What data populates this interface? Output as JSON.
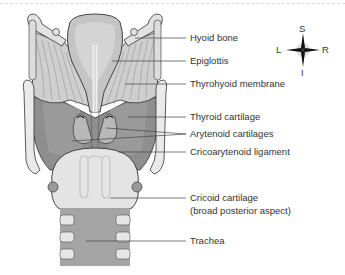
{
  "figure": {
    "colors": {
      "cartilage_dark": "#8c8c8c",
      "cartilage_mid": "#a8a8a8",
      "cartilage_light": "#e6e6e6",
      "membrane": "#c8c8c8",
      "outline": "#333333",
      "leader_line": "#444444"
    }
  },
  "labels": [
    {
      "id": "hyoid-bone",
      "text": "Hyoid bone",
      "y": 32
    },
    {
      "id": "epiglottis",
      "text": "Epiglottis",
      "y": 55
    },
    {
      "id": "thyrohyoid-membrane",
      "text": "Thyrohyoid membrane",
      "y": 78
    },
    {
      "id": "thyroid-cartilage",
      "text": "Thyroid cartilage",
      "y": 111
    },
    {
      "id": "arytenoid-cartilages",
      "text": "Arytenoid cartilages",
      "y": 128
    },
    {
      "id": "cricoarytenoid-ligament",
      "text": "Cricoarytenoid ligament",
      "y": 146
    },
    {
      "id": "cricoid-cartilage",
      "text": "Cricoid cartilage",
      "y": 192
    },
    {
      "id": "cricoid-cartilage-sub",
      "text": "(broad posterior aspect)",
      "y": 205
    },
    {
      "id": "trachea",
      "text": "Trachea",
      "y": 235
    }
  ],
  "compass": {
    "superior": "S",
    "inferior": "I",
    "left": "L",
    "right": "R"
  }
}
